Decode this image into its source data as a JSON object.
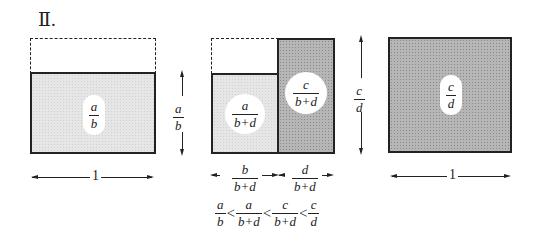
{
  "title": "Ⅱ.",
  "colors": {
    "light_fill": "#e6e6e6",
    "dark_fill": "#b6b6b6",
    "stroke": "#222222"
  },
  "panel1": {
    "area_label": {
      "num": "a",
      "den": "b"
    },
    "height_label": {
      "num": "a",
      "den": "b"
    },
    "width_label": "1"
  },
  "panel2": {
    "left_area_label": {
      "num": "a",
      "den": "b+d"
    },
    "right_area_label": {
      "num": "c",
      "den": "b+d"
    },
    "left_width_label": {
      "num": "b",
      "den": "b+d"
    },
    "right_width_label": {
      "num": "d",
      "den": "b+d"
    },
    "inequality": [
      {
        "num": "a",
        "den": "b"
      },
      {
        "op": "<"
      },
      {
        "num": "a",
        "den": "b+d"
      },
      {
        "op": "<"
      },
      {
        "num": "c",
        "den": "b+d"
      },
      {
        "op": "<"
      },
      {
        "num": "c",
        "den": "d"
      }
    ]
  },
  "panel3": {
    "area_label": {
      "num": "c",
      "den": "d"
    },
    "height_label": {
      "num": "c",
      "den": "d"
    },
    "width_label": "1"
  }
}
